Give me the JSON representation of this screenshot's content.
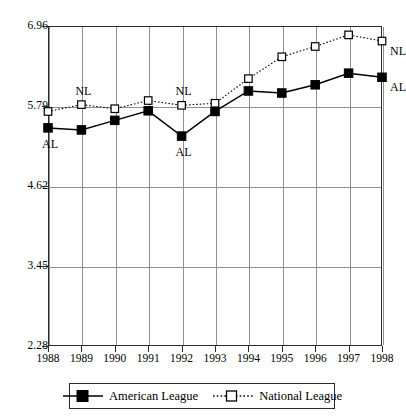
{
  "chart_data": {
    "type": "line",
    "title": "",
    "xlabel": "",
    "ylabel": "",
    "categories": [
      "1988",
      "1989",
      "1990",
      "1991",
      "1992",
      "1993",
      "1994",
      "1995",
      "1996",
      "1997",
      "1998"
    ],
    "x": [
      1988,
      1989,
      1990,
      1991,
      1992,
      1993,
      1994,
      1995,
      1996,
      1997,
      1998
    ],
    "series": [
      {
        "name": "American League",
        "short_name": "AL",
        "marker": "filled-square",
        "linestyle": "solid",
        "color": "#000000",
        "values": [
          5.47,
          5.44,
          5.58,
          5.72,
          5.35,
          5.71,
          6.01,
          5.98,
          6.1,
          6.27,
          6.21
        ]
      },
      {
        "name": "National League",
        "short_name": "NL",
        "marker": "open-square",
        "linestyle": "dotted",
        "color": "#000000",
        "values": [
          5.71,
          5.81,
          5.75,
          5.87,
          5.8,
          5.83,
          6.19,
          6.51,
          6.66,
          6.83,
          6.74
        ]
      }
    ],
    "ylim": [
      2.28,
      6.96
    ],
    "yticks": [
      "2.28",
      "3.45",
      "4.62",
      "5.79",
      "6.96"
    ],
    "ytick_values": [
      2.28,
      3.45,
      4.62,
      5.79,
      6.96
    ],
    "grid": "both",
    "legend_position": "bottom-outside"
  },
  "annotations": [
    {
      "text": "AL",
      "series": "American League",
      "near_category": "1988"
    },
    {
      "text": "NL",
      "series": "National League",
      "near_category": "1989"
    },
    {
      "text": "NL",
      "series": "National League",
      "near_category": "1992"
    },
    {
      "text": "AL",
      "series": "American League",
      "near_category": "1992"
    },
    {
      "text": "NL",
      "series": "National League",
      "near_category": "1998"
    },
    {
      "text": "AL",
      "series": "American League",
      "near_category": "1998"
    }
  ],
  "legend": {
    "entries": [
      {
        "label": "American League",
        "marker": "filled-square",
        "linestyle": "solid"
      },
      {
        "label": "National League",
        "marker": "open-square",
        "linestyle": "dotted"
      }
    ]
  }
}
